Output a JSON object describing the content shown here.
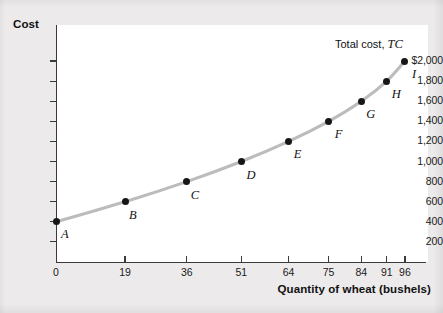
{
  "chart_data": {
    "type": "line",
    "title": "",
    "xlabel": "Quantity of wheat (bushels)",
    "ylabel": "Cost",
    "series_label_prefix": "Total cost,",
    "series_label_symbol": "TC",
    "grid": false,
    "legend_position": "inline-top-right",
    "xlim": [
      0,
      104
    ],
    "ylim": [
      0,
      2100
    ],
    "x_ticks": [
      0,
      19,
      36,
      51,
      64,
      75,
      84,
      91,
      96
    ],
    "x_tick_labels": [
      "0",
      "19",
      "36",
      "51",
      "64",
      "75",
      "84",
      "91",
      "96"
    ],
    "y_ticks": [
      200,
      400,
      600,
      800,
      1000,
      1200,
      1400,
      1600,
      1800,
      2000
    ],
    "y_tick_labels": [
      "200",
      "400",
      "600",
      "800",
      "1,000",
      "1,200",
      "1,400",
      "1,600",
      "1,800",
      "$2,000"
    ],
    "points": [
      {
        "label": "A",
        "x": 0,
        "y": 400,
        "label_dx": 5,
        "label_dy": 13
      },
      {
        "label": "B",
        "x": 19,
        "y": 600,
        "label_dx": 4,
        "label_dy": 14
      },
      {
        "label": "C",
        "x": 36,
        "y": 800,
        "label_dx": 4,
        "label_dy": 14
      },
      {
        "label": "D",
        "x": 51,
        "y": 1000,
        "label_dx": 5,
        "label_dy": 14
      },
      {
        "label": "E",
        "x": 64,
        "y": 1200,
        "label_dx": 5,
        "label_dy": 14
      },
      {
        "label": "F",
        "x": 75,
        "y": 1400,
        "label_dx": 6,
        "label_dy": 14
      },
      {
        "label": "G",
        "x": 84,
        "y": 1600,
        "label_dx": 5,
        "label_dy": 14
      },
      {
        "label": "H",
        "x": 91,
        "y": 1800,
        "label_dx": 5,
        "label_dy": 14
      },
      {
        "label": "I",
        "x": 96,
        "y": 2000,
        "label_dx": 7,
        "label_dy": 14
      }
    ],
    "colors": {
      "curve": "#bcbcbc",
      "point": "#161616",
      "axis": "#3a3a3a",
      "text": "#111111",
      "plot_background": "#ffffff",
      "figure_background": "#eceaea"
    }
  }
}
